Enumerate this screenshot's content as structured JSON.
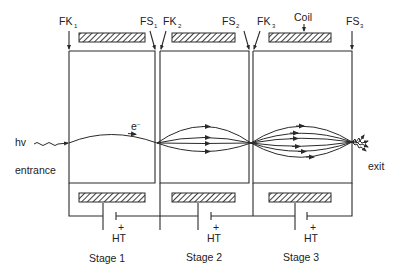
{
  "diagram": {
    "top_labels": [
      {
        "text": "FK",
        "sub": "1",
        "x": 59,
        "y": 25
      },
      {
        "text": "FS",
        "sub": "1",
        "x": 140,
        "y": 25
      },
      {
        "text": "FK",
        "sub": "2",
        "x": 162,
        "y": 25
      },
      {
        "text": "FS",
        "sub": "2",
        "x": 222,
        "y": 25
      },
      {
        "text": "FK",
        "sub": "3",
        "x": 257,
        "y": 25
      },
      {
        "text": "FS",
        "sub": "3",
        "x": 346,
        "y": 25
      }
    ],
    "coil_label": "Coil",
    "electron_label": "e",
    "electron_sup": "–",
    "input_label": "hv",
    "entrance_label": "entrance",
    "exit_label": "exit",
    "battery_plus": "+",
    "battery_label": "HT",
    "stages": [
      {
        "label": "Stage 1"
      },
      {
        "label": "Stage 2"
      },
      {
        "label": "Stage 3"
      }
    ],
    "icons": {
      "coil": "hatched-rectangle",
      "battery": "dc-cell-symbol",
      "photon": "wavy-arrow",
      "electron_ray": "arrowed-curve"
    },
    "colors": {
      "line": "#2a2a2a",
      "background": "#ffffff"
    }
  }
}
